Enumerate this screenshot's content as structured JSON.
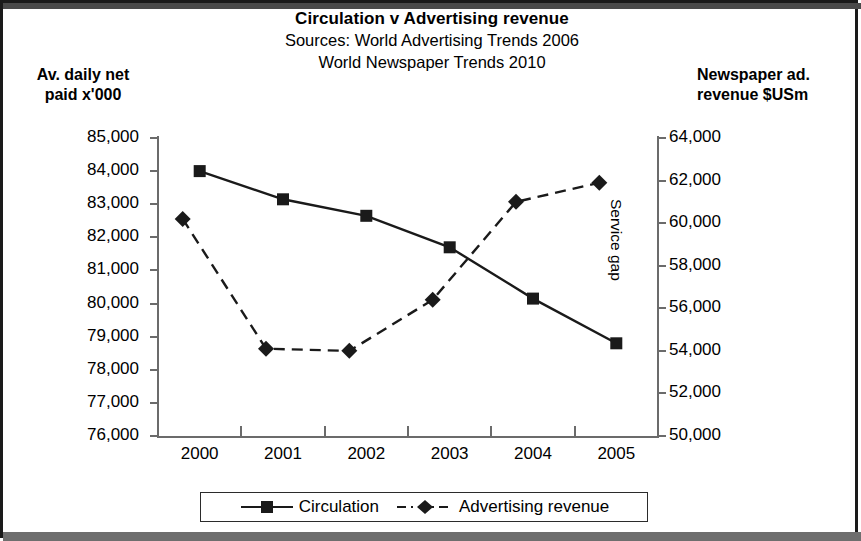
{
  "chart_data": {
    "type": "line",
    "title": "Circulation v Advertising revenue",
    "subtitle_lines": [
      "Sources: World Advertising Trends 2006",
      "World Newspaper Trends 2010"
    ],
    "xlabel": "",
    "categories": [
      "2000",
      "2001",
      "2002",
      "2003",
      "2004",
      "2005"
    ],
    "grid": false,
    "legend_position": "bottom",
    "annotations": [
      {
        "text": "Service gap",
        "orientation": "vertical",
        "near": "right-axis"
      }
    ],
    "axes": {
      "left": {
        "label_lines": [
          "Av. daily net",
          "paid  x'000"
        ],
        "ylim": [
          76000,
          85000
        ],
        "tick_step": 1000,
        "ticks": [
          "85,000",
          "84,000",
          "83,000",
          "82,000",
          "81,000",
          "80,000",
          "79,000",
          "78,000",
          "77,000",
          "76,000"
        ],
        "tick_values": [
          85000,
          84000,
          83000,
          82000,
          81000,
          80000,
          79000,
          78000,
          77000,
          76000
        ]
      },
      "right": {
        "label_lines": [
          "Newspaper ad.",
          "revenue $USm"
        ],
        "ylim": [
          50000,
          64000
        ],
        "tick_step": 2000,
        "ticks": [
          "64,000",
          "62,000",
          "60,000",
          "58,000",
          "56,000",
          "54,000",
          "52,000",
          "50,000"
        ],
        "tick_values": [
          64000,
          62000,
          60000,
          58000,
          56000,
          54000,
          52000,
          50000
        ]
      }
    },
    "series": [
      {
        "name": "Circulation",
        "axis": "left",
        "marker": "square",
        "line_style": "solid",
        "color": "#1a1a1a",
        "values": [
          84000,
          83150,
          82650,
          81700,
          80150,
          78800
        ]
      },
      {
        "name": "Advertising revenue",
        "axis": "right",
        "marker": "diamond",
        "line_style": "dashed",
        "color": "#1a1a1a",
        "values": [
          60200,
          54100,
          54000,
          56400,
          61000,
          61900
        ]
      }
    ]
  },
  "legend": {
    "items": [
      {
        "label": "Circulation",
        "marker": "square",
        "line_style": "solid"
      },
      {
        "label": "Advertising revenue",
        "marker": "diamond",
        "line_style": "dashed"
      }
    ]
  }
}
